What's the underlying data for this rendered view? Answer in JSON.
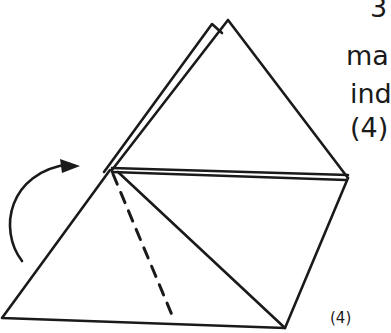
{
  "diagram": {
    "type": "origami-fold-step",
    "stroke_color": "#1a1a1a",
    "background": "#ffffff",
    "step_label": "(4)",
    "side_text": {
      "line1": "3",
      "line2": "ma",
      "line3": "ind",
      "line4": "(4)"
    },
    "elements": {
      "back_layer_apex": [
        212,
        24
      ],
      "front_apex": [
        228,
        20
      ],
      "left_fold_point": [
        110,
        170
      ],
      "right_vertex": [
        348,
        178
      ],
      "bottom_left": [
        2,
        318
      ],
      "bottom_right": [
        285,
        328
      ],
      "dashed_valley_fold": {
        "from": [
          113,
          172
        ],
        "to": [
          172,
          315
        ]
      },
      "rotation_arrow": "curved-arrow-clockwise"
    }
  }
}
